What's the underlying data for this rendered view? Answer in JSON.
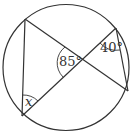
{
  "diagram": {
    "type": "circle-geometry",
    "circle": {
      "cx": 66,
      "cy": 67.5,
      "r": 63
    },
    "points": {
      "A": [
        25,
        19
      ],
      "B": [
        22,
        116
      ],
      "C": [
        116,
        28
      ],
      "D": [
        128,
        91
      ],
      "X": [
        82,
        59
      ]
    },
    "labels": {
      "angle_center": "85°",
      "angle_top_right": "40°",
      "angle_bottom_left": "x"
    },
    "colors": {
      "stroke": "#333333",
      "background": "#ffffff"
    }
  }
}
